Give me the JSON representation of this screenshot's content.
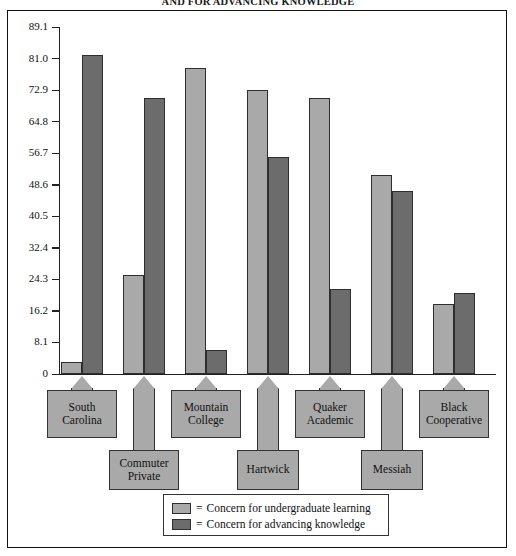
{
  "title": "AND FOR ADVANCING KNOWLEDGE",
  "colors": {
    "light": "#a9a9a9",
    "dark": "#6c6c6c",
    "outline": "#2e2e2e",
    "frame": "#111111"
  },
  "axis": {
    "ylabel": "Percentile",
    "ticks": [
      "89.1",
      "81.0",
      "72.9",
      "64.8",
      "56.7",
      "48.6",
      "40.5",
      "32.4",
      "24.3",
      "16.2",
      "8.1",
      "0"
    ],
    "max": 89.1,
    "min": 0
  },
  "legend": {
    "equals": "=",
    "items": [
      {
        "label": "Concern for undergraduate learning",
        "key": "light"
      },
      {
        "label": "Concern for advancing knowledge",
        "key": "dark"
      }
    ]
  },
  "chart_data": {
    "type": "bar",
    "title": "AND FOR ADVANCING KNOWLEDGE",
    "xlabel": "",
    "ylabel": "Percentile",
    "ylim": [
      0,
      89.1
    ],
    "yticks": [
      0,
      8.1,
      16.2,
      24.3,
      32.4,
      40.5,
      48.6,
      56.7,
      64.8,
      72.9,
      81.0,
      89.1
    ],
    "grid": false,
    "legend_position": "bottom",
    "categories": [
      "South Carolina",
      "Commuter Private",
      "Mountain College",
      "Hartwick",
      "Quaker Academic",
      "Messiah",
      "Black Cooperative"
    ],
    "series": [
      {
        "name": "Concern for undergraduate learning",
        "color": "#a9a9a9",
        "values": [
          3.0,
          25.5,
          78.5,
          72.9,
          70.8,
          51.0,
          18.0
        ]
      },
      {
        "name": "Concern for advancing knowledge",
        "color": "#6c6c6c",
        "values": [
          82.0,
          70.8,
          6.2,
          55.8,
          21.8,
          47.0,
          20.8
        ]
      }
    ]
  },
  "categories": [
    {
      "line1": "South",
      "line2": "Carolina",
      "row": "top"
    },
    {
      "line1": "Commuter",
      "line2": "Private",
      "row": "bottom"
    },
    {
      "line1": "Mountain",
      "line2": "College",
      "row": "top"
    },
    {
      "line1": "Hartwick",
      "line2": "",
      "row": "bottom"
    },
    {
      "line1": "Quaker",
      "line2": "Academic",
      "row": "top"
    },
    {
      "line1": "Messiah",
      "line2": "",
      "row": "bottom"
    },
    {
      "line1": "Black",
      "line2": "Cooperative",
      "row": "top"
    }
  ]
}
